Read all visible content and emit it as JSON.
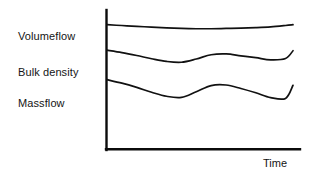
{
  "chart_data": {
    "type": "line",
    "title": "",
    "xlabel": "Time",
    "ylabel": "",
    "grid": false,
    "legend_position": "left-inline-labels",
    "axis_style": "L-shaped open axes, no tick marks, no numeric scale",
    "x": [
      0,
      8,
      16,
      24,
      32,
      40,
      48,
      56,
      64,
      72,
      80,
      88,
      96,
      100
    ],
    "xlim": [
      0,
      100
    ],
    "ylim": [
      0,
      100
    ],
    "series": [
      {
        "name": "Volumeflow",
        "label": "Volumeflow",
        "values": [
          92,
          91.4,
          90.8,
          90.2,
          89.6,
          89.2,
          89.0,
          89.0,
          89.2,
          89.4,
          89.8,
          90.4,
          91.4,
          92.0
        ]
      },
      {
        "name": "Bulk density",
        "label": "Bulk density",
        "values": [
          73,
          71.2,
          69.0,
          66.6,
          64.6,
          64.0,
          66.4,
          69.6,
          70.2,
          68.8,
          67.4,
          65.8,
          66.8,
          72.6
        ]
      },
      {
        "name": "Massflow",
        "label": "Massflow",
        "values": [
          51,
          48.4,
          45.2,
          41.6,
          38.6,
          37.8,
          42.0,
          46.6,
          47.0,
          44.4,
          41.2,
          37.6,
          37.0,
          46.8
        ]
      }
    ]
  },
  "labels": {
    "volumeflow": "Volumeflow",
    "bulk_density": "Bulk density",
    "massflow": "Massflow",
    "time_axis": "Time"
  },
  "colors": {
    "background": "#ffffff",
    "axis": "#0b0b0b",
    "curve": "#111111",
    "text": "#141414"
  }
}
